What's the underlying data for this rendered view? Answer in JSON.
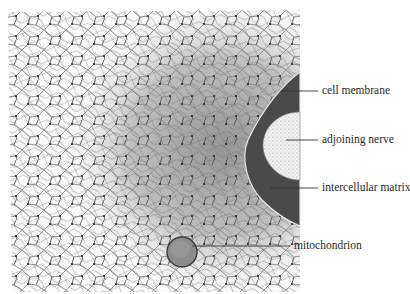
{
  "diagram": {
    "colors": {
      "background": "#ffffff",
      "network_lines": "#5a5a5a",
      "shaded_region": "#a8a8a8",
      "cell_membrane_dark": "#4a4a4a",
      "nerve_fill": "#eeeeee",
      "mitochondrion": "#8c8c8c"
    },
    "labels": [
      {
        "id": "cell-membrane",
        "text": "cell membrane"
      },
      {
        "id": "adjoining-nerve",
        "text": "adjoining nerve"
      },
      {
        "id": "intercellular-matrix",
        "text": "intercellular matrix"
      },
      {
        "id": "mitochondrion",
        "text": "mitochondrion"
      }
    ]
  }
}
